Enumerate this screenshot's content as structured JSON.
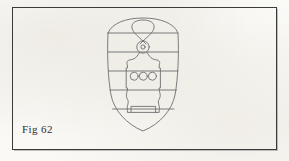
{
  "page": {
    "background_color": "#fcfcfa",
    "width": 289,
    "height": 161
  },
  "frame": {
    "name": "figure-border",
    "stroke_color": "#3b3b3b",
    "stroke_width": 1,
    "x": 12,
    "y": 7,
    "width": 265,
    "height": 143
  },
  "caption": {
    "text": "Fig 62",
    "color": "#2f2d2b",
    "font_size_px": 11,
    "x": 22,
    "y": 123
  },
  "figure": {
    "title": "Fig 62",
    "type": "line-drawing",
    "stroke_color": "#6e6e70",
    "fill_color": "none",
    "bounds": {
      "x": 104,
      "y": 18,
      "width": 78,
      "height": 113
    },
    "shield": {
      "name": "shield-outline",
      "left": 104,
      "right": 182,
      "top": 18,
      "bottom": 131,
      "shape": "arched top, straight sides, pointed rounded base"
    },
    "bands": {
      "name": "horizontal-bands",
      "count": 5,
      "description": "barry - five horizontal dividing lines across the shield",
      "y_positions": [
        33,
        52,
        71,
        90,
        109
      ]
    },
    "device": {
      "name": "central-device",
      "description": "vertical ornamental figure with upper teardrop loop, annulet ring, flanged body with three roundels, and flared foot",
      "parts": [
        {
          "name": "top-loop",
          "shape": "teardrop",
          "cx": 143,
          "cy": 27
        },
        {
          "name": "annulet-ring",
          "shape": "circle",
          "cx": 143,
          "cy": 47,
          "r": 6
        },
        {
          "name": "annulet-center",
          "shape": "circle",
          "cx": 143,
          "cy": 47,
          "r": 2
        },
        {
          "name": "body-plate",
          "shape": "flanged-rectangle",
          "x": 127,
          "y": 62,
          "width": 32,
          "height": 50
        },
        {
          "name": "roundel-left",
          "shape": "circle",
          "cx": 134,
          "cy": 76,
          "r": 4
        },
        {
          "name": "roundel-center",
          "shape": "circle",
          "cx": 143,
          "cy": 76,
          "r": 4
        },
        {
          "name": "roundel-right",
          "shape": "circle",
          "cx": 152,
          "cy": 76,
          "r": 4
        }
      ],
      "roundel_count": 3
    }
  }
}
